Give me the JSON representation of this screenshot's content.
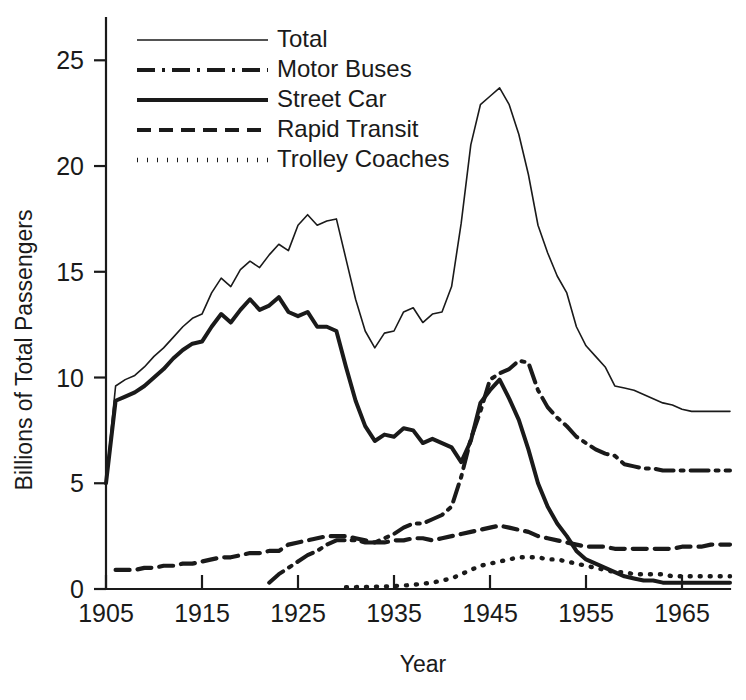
{
  "chart_data": {
    "type": "line",
    "title": "",
    "xlabel": "Year",
    "ylabel": "Billions of Total Passengers",
    "xlim": [
      1905,
      1970
    ],
    "ylim": [
      0,
      27
    ],
    "grid": false,
    "legend_position": "top-left-inside",
    "xticks": [
      1905,
      1915,
      1925,
      1935,
      1945,
      1955,
      1965
    ],
    "xtick_labels": [
      "1905",
      "1915",
      "1925",
      "1935",
      "1945",
      "1955",
      "1965"
    ],
    "yticks": [
      0,
      5,
      10,
      15,
      20,
      25
    ],
    "ytick_labels": [
      "0",
      "5",
      "10",
      "15",
      "20",
      "25"
    ],
    "series": [
      {
        "name": "Total",
        "style": "solid-thin",
        "stroke_width": 1.6,
        "dasharray": "",
        "x": [
          1905,
          1906,
          1907,
          1908,
          1909,
          1910,
          1911,
          1912,
          1913,
          1914,
          1915,
          1916,
          1917,
          1918,
          1919,
          1920,
          1921,
          1922,
          1923,
          1924,
          1925,
          1926,
          1927,
          1928,
          1929,
          1930,
          1931,
          1932,
          1933,
          1934,
          1935,
          1936,
          1937,
          1938,
          1939,
          1940,
          1941,
          1942,
          1943,
          1944,
          1945,
          1946,
          1947,
          1948,
          1949,
          1950,
          1951,
          1952,
          1953,
          1954,
          1955,
          1956,
          1957,
          1958,
          1959,
          1960,
          1961,
          1962,
          1963,
          1964,
          1965,
          1966,
          1967,
          1968,
          1969,
          1970
        ],
        "y": [
          5.1,
          9.6,
          9.9,
          10.1,
          10.5,
          11.0,
          11.4,
          11.9,
          12.4,
          12.8,
          13.0,
          14.0,
          14.7,
          14.3,
          15.1,
          15.5,
          15.2,
          15.8,
          16.3,
          16.0,
          17.2,
          17.7,
          17.2,
          17.4,
          17.5,
          15.6,
          13.7,
          12.2,
          11.4,
          12.1,
          12.2,
          13.1,
          13.3,
          12.6,
          13.0,
          13.1,
          14.3,
          17.3,
          21.0,
          22.9,
          23.3,
          23.7,
          22.9,
          21.5,
          19.6,
          17.2,
          15.9,
          14.8,
          14.0,
          12.4,
          11.5,
          11.0,
          10.5,
          9.6,
          9.5,
          9.4,
          9.2,
          9.0,
          8.8,
          8.7,
          8.5,
          8.4,
          8.4,
          8.4,
          8.4,
          8.4
        ]
      },
      {
        "name": "Motor Buses",
        "style": "dash-dot",
        "stroke_width": 4.0,
        "dasharray": "18,7,3,7",
        "x": [
          1922,
          1923,
          1924,
          1925,
          1926,
          1927,
          1928,
          1929,
          1930,
          1931,
          1932,
          1933,
          1934,
          1935,
          1936,
          1937,
          1938,
          1939,
          1940,
          1941,
          1942,
          1943,
          1944,
          1945,
          1946,
          1947,
          1948,
          1949,
          1950,
          1951,
          1952,
          1953,
          1954,
          1955,
          1956,
          1957,
          1958,
          1959,
          1960,
          1961,
          1962,
          1963,
          1964,
          1965,
          1966,
          1967,
          1968,
          1969,
          1970
        ],
        "y": [
          0.3,
          0.7,
          1.0,
          1.3,
          1.6,
          1.8,
          2.1,
          2.3,
          2.3,
          2.3,
          2.2,
          2.2,
          2.4,
          2.6,
          2.9,
          3.1,
          3.1,
          3.3,
          3.5,
          3.9,
          5.3,
          7.1,
          8.4,
          9.9,
          10.2,
          10.4,
          10.8,
          10.7,
          9.4,
          8.6,
          8.1,
          7.7,
          7.2,
          6.9,
          6.6,
          6.4,
          6.3,
          5.9,
          5.8,
          5.7,
          5.7,
          5.6,
          5.6,
          5.6,
          5.6,
          5.6,
          5.6,
          5.6,
          5.6
        ]
      },
      {
        "name": "Street Car",
        "style": "solid-thick",
        "stroke_width": 4.0,
        "dasharray": "",
        "x": [
          1905,
          1906,
          1907,
          1908,
          1909,
          1910,
          1911,
          1912,
          1913,
          1914,
          1915,
          1916,
          1917,
          1918,
          1919,
          1920,
          1921,
          1922,
          1923,
          1924,
          1925,
          1926,
          1927,
          1928,
          1929,
          1930,
          1931,
          1932,
          1933,
          1934,
          1935,
          1936,
          1937,
          1938,
          1939,
          1940,
          1941,
          1942,
          1943,
          1944,
          1945,
          1946,
          1947,
          1948,
          1949,
          1950,
          1951,
          1952,
          1953,
          1954,
          1955,
          1956,
          1957,
          1958,
          1959,
          1960,
          1961,
          1962,
          1963,
          1964,
          1965,
          1966,
          1967,
          1968,
          1969,
          1970
        ],
        "y": [
          5.0,
          8.9,
          9.1,
          9.3,
          9.6,
          10.0,
          10.4,
          10.9,
          11.3,
          11.6,
          11.7,
          12.4,
          13.0,
          12.6,
          13.2,
          13.7,
          13.2,
          13.4,
          13.8,
          13.1,
          12.9,
          13.1,
          12.4,
          12.4,
          12.2,
          10.5,
          8.9,
          7.7,
          7.0,
          7.3,
          7.2,
          7.6,
          7.5,
          6.9,
          7.1,
          6.9,
          6.7,
          6.0,
          7.0,
          8.8,
          9.4,
          9.9,
          9.0,
          8.0,
          6.6,
          5.0,
          3.9,
          3.1,
          2.5,
          1.8,
          1.4,
          1.2,
          1.0,
          0.8,
          0.6,
          0.5,
          0.4,
          0.4,
          0.3,
          0.3,
          0.3,
          0.3,
          0.3,
          0.3,
          0.3,
          0.3
        ]
      },
      {
        "name": "Rapid Transit",
        "style": "dashed",
        "stroke_width": 4.2,
        "dasharray": "14,8",
        "x": [
          1906,
          1907,
          1908,
          1909,
          1910,
          1911,
          1912,
          1913,
          1914,
          1915,
          1916,
          1917,
          1918,
          1919,
          1920,
          1921,
          1922,
          1923,
          1924,
          1925,
          1926,
          1927,
          1928,
          1929,
          1930,
          1931,
          1932,
          1933,
          1934,
          1935,
          1936,
          1937,
          1938,
          1939,
          1940,
          1941,
          1942,
          1943,
          1944,
          1945,
          1946,
          1947,
          1948,
          1949,
          1950,
          1951,
          1952,
          1953,
          1954,
          1955,
          1956,
          1957,
          1958,
          1959,
          1960,
          1961,
          1962,
          1963,
          1964,
          1965,
          1966,
          1967,
          1968,
          1969,
          1970
        ],
        "y": [
          0.9,
          0.9,
          0.9,
          1.0,
          1.0,
          1.1,
          1.1,
          1.2,
          1.2,
          1.3,
          1.4,
          1.5,
          1.5,
          1.6,
          1.7,
          1.7,
          1.8,
          1.8,
          2.1,
          2.2,
          2.3,
          2.4,
          2.5,
          2.5,
          2.5,
          2.4,
          2.3,
          2.2,
          2.2,
          2.3,
          2.3,
          2.4,
          2.4,
          2.3,
          2.4,
          2.5,
          2.6,
          2.7,
          2.8,
          2.9,
          3.0,
          2.9,
          2.8,
          2.7,
          2.5,
          2.4,
          2.3,
          2.2,
          2.1,
          2.0,
          2.0,
          2.0,
          1.9,
          1.9,
          1.9,
          1.9,
          1.9,
          1.9,
          1.9,
          2.0,
          2.0,
          2.0,
          2.1,
          2.1,
          2.1
        ]
      },
      {
        "name": "Trolley Coaches",
        "style": "dotted",
        "stroke_width": 4.4,
        "dasharray": "1,9",
        "x": [
          1930,
          1931,
          1932,
          1933,
          1934,
          1935,
          1936,
          1937,
          1938,
          1939,
          1940,
          1941,
          1942,
          1943,
          1944,
          1945,
          1946,
          1947,
          1948,
          1949,
          1950,
          1951,
          1952,
          1953,
          1954,
          1955,
          1956,
          1957,
          1958,
          1959,
          1960,
          1961,
          1962,
          1963,
          1964,
          1965,
          1966,
          1967,
          1968,
          1969,
          1970
        ],
        "y": [
          0.08,
          0.09,
          0.1,
          0.11,
          0.12,
          0.14,
          0.16,
          0.2,
          0.25,
          0.3,
          0.4,
          0.5,
          0.7,
          0.9,
          1.1,
          1.2,
          1.3,
          1.4,
          1.5,
          1.5,
          1.5,
          1.4,
          1.4,
          1.3,
          1.2,
          1.1,
          1.0,
          0.9,
          0.8,
          0.8,
          0.7,
          0.7,
          0.7,
          0.7,
          0.6,
          0.6,
          0.6,
          0.6,
          0.6,
          0.6,
          0.6
        ]
      }
    ]
  },
  "legend": {
    "items": [
      {
        "label": "Total",
        "style": "solid-thin"
      },
      {
        "label": "Motor Buses",
        "style": "dash-dot"
      },
      {
        "label": "Street Car",
        "style": "solid-thick"
      },
      {
        "label": "Rapid Transit",
        "style": "dashed"
      },
      {
        "label": "Trolley Coaches",
        "style": "dotted"
      }
    ]
  },
  "colors": {
    "ink": "#1a1a1a",
    "background": "#ffffff"
  }
}
